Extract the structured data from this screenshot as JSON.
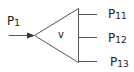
{
  "diagram": {
    "type": "splitter",
    "node": {
      "label": "v",
      "shape": "triangle"
    },
    "input": {
      "base": "P",
      "sub": "1"
    },
    "outputs": [
      {
        "base": "P",
        "sub": "11"
      },
      {
        "base": "P",
        "sub": "12"
      },
      {
        "base": "P",
        "sub": "13"
      }
    ],
    "colors": {
      "line": "#555555",
      "text": "#222222",
      "background": "#ffffff"
    }
  }
}
